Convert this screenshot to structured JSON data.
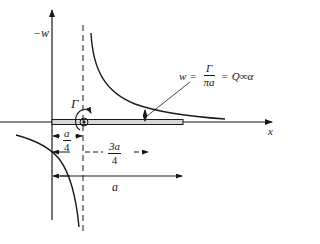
{
  "diagram": {
    "type": "thin airfoil vortex induced velocity",
    "axes": {
      "vertical_label": "−w",
      "horizontal_label": "x"
    },
    "vortex": {
      "symbol": "Γ",
      "position_label": "a/4"
    },
    "annotation": {
      "lhs": "w",
      "equals1": "=",
      "frac_num": "Γ",
      "frac_den": "πa",
      "equals2": "=",
      "rhs": "Q∞α"
    },
    "dimensions": [
      {
        "id": "quarter-chord",
        "num": "a",
        "den": "4"
      },
      {
        "id": "three-quarter-chord",
        "num": "3a",
        "den": "4"
      },
      {
        "id": "chord",
        "label": "a"
      }
    ],
    "colors": {
      "ink": "#1a1a1a",
      "background": "#ffffff",
      "plate_fill": "#d8d8d8"
    }
  }
}
